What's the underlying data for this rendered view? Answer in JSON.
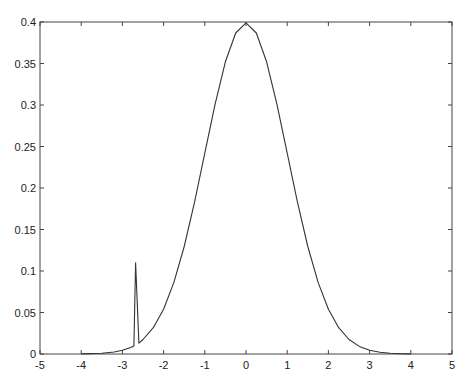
{
  "chart_data": {
    "type": "line",
    "title": "",
    "xlabel": "",
    "ylabel": "",
    "xlim": [
      -5,
      5
    ],
    "ylim": [
      0,
      0.4
    ],
    "grid": false,
    "legend": null,
    "x_ticks": [
      -5,
      -4,
      -3,
      -2,
      -1,
      0,
      1,
      2,
      3,
      4,
      5
    ],
    "x_tick_labels": [
      "-5",
      "-4",
      "-3",
      "-2",
      "-1",
      "0",
      "1",
      "2",
      "3",
      "4",
      "5"
    ],
    "y_ticks": [
      0,
      0.05,
      0.1,
      0.15,
      0.2,
      0.25,
      0.3,
      0.35,
      0.4
    ],
    "y_tick_labels": [
      "0",
      "0.05",
      "0.1",
      "0.15",
      "0.2",
      "0.25",
      "0.3",
      "0.35",
      "0.4"
    ],
    "series": [
      {
        "name": "standard normal density with spike artifact near x=-2.7",
        "color": "#333333",
        "x": [
          -4.0,
          -3.5,
          -3.2,
          -3.0,
          -2.8,
          -2.72,
          -2.68,
          -2.6,
          -2.5,
          -2.25,
          -2.0,
          -1.75,
          -1.5,
          -1.25,
          -1.0,
          -0.75,
          -0.5,
          -0.25,
          0.0,
          0.25,
          0.5,
          0.75,
          1.0,
          1.25,
          1.5,
          1.75,
          2.0,
          2.25,
          2.5,
          2.75,
          3.0,
          3.25,
          3.5,
          3.75,
          4.0
        ],
        "y": [
          0.0001,
          0.0009,
          0.0024,
          0.0044,
          0.0079,
          0.0098,
          0.11,
          0.013,
          0.0175,
          0.0317,
          0.054,
          0.0863,
          0.1295,
          0.1826,
          0.242,
          0.3011,
          0.3521,
          0.3867,
          0.3989,
          0.3867,
          0.3521,
          0.3011,
          0.242,
          0.1826,
          0.1295,
          0.0863,
          0.054,
          0.0317,
          0.0175,
          0.0091,
          0.0044,
          0.002,
          0.0009,
          0.0004,
          0.0001
        ]
      }
    ]
  }
}
